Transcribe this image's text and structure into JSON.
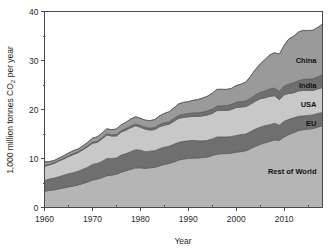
{
  "chart_data": {
    "type": "area",
    "title": "",
    "subtitle": "",
    "xlabel": "Year",
    "ylabel": "1,000 million tonnes CO2 per year",
    "ylabel_parts": {
      "pre": "1,000 million tonnes CO",
      "sub": "2",
      "post": " per year"
    },
    "stacked": true,
    "grid": false,
    "legend_position": "inline-right",
    "xlim": [
      1960,
      2018
    ],
    "ylim": [
      0,
      40
    ],
    "xticks": [
      1960,
      1970,
      1980,
      1990,
      2000,
      2010
    ],
    "xtick_labels": [
      "1960",
      "1970",
      "1980",
      "1990",
      "2000",
      "2010"
    ],
    "xminor_step": 5,
    "yticks": [
      0,
      10,
      20,
      30,
      40
    ],
    "ytick_labels": [
      "0",
      "10",
      "20",
      "30",
      "40"
    ],
    "yminor_step": 5,
    "x": [
      1960,
      1961,
      1962,
      1963,
      1964,
      1965,
      1966,
      1967,
      1968,
      1969,
      1970,
      1971,
      1972,
      1973,
      1974,
      1975,
      1976,
      1977,
      1978,
      1979,
      1980,
      1981,
      1982,
      1983,
      1984,
      1985,
      1986,
      1987,
      1988,
      1989,
      1990,
      1991,
      1992,
      1993,
      1994,
      1995,
      1996,
      1997,
      1998,
      1999,
      2000,
      2001,
      2002,
      2003,
      2004,
      2005,
      2006,
      2007,
      2008,
      2009,
      2010,
      2011,
      2012,
      2013,
      2014,
      2015,
      2016,
      2017,
      2018
    ],
    "series": [
      {
        "name": "Rest of World",
        "color": "#b5b5b5",
        "label": "Rest of World",
        "values": [
          3.3,
          3.5,
          3.6,
          3.8,
          4.0,
          4.2,
          4.4,
          4.6,
          4.9,
          5.2,
          5.6,
          5.8,
          6.1,
          6.5,
          6.6,
          6.8,
          7.2,
          7.5,
          7.8,
          8.1,
          8.1,
          8.0,
          8.1,
          8.2,
          8.5,
          8.8,
          9.0,
          9.3,
          9.7,
          9.9,
          10.0,
          10.1,
          10.1,
          10.2,
          10.3,
          10.6,
          10.9,
          11.0,
          11.0,
          11.1,
          11.3,
          11.4,
          11.6,
          12.0,
          12.5,
          12.9,
          13.2,
          13.5,
          13.8,
          13.7,
          14.4,
          14.9,
          15.3,
          15.7,
          15.9,
          16.0,
          16.1,
          16.4,
          16.7
        ]
      },
      {
        "name": "EU",
        "color": "#6f6f6f",
        "label": "EU",
        "values": [
          2.2,
          2.3,
          2.4,
          2.5,
          2.6,
          2.7,
          2.7,
          2.8,
          2.9,
          3.0,
          3.2,
          3.2,
          3.3,
          3.5,
          3.4,
          3.3,
          3.5,
          3.5,
          3.6,
          3.7,
          3.6,
          3.4,
          3.4,
          3.4,
          3.5,
          3.5,
          3.5,
          3.6,
          3.6,
          3.6,
          3.6,
          3.6,
          3.5,
          3.4,
          3.4,
          3.4,
          3.5,
          3.4,
          3.4,
          3.4,
          3.4,
          3.5,
          3.4,
          3.5,
          3.5,
          3.5,
          3.5,
          3.4,
          3.4,
          3.1,
          3.2,
          3.1,
          3.0,
          2.9,
          2.8,
          2.8,
          2.8,
          2.8,
          2.7
        ]
      },
      {
        "name": "USA",
        "color": "#c8c8c8",
        "label": "USA",
        "values": [
          2.9,
          2.9,
          3.0,
          3.2,
          3.3,
          3.5,
          3.7,
          3.8,
          4.0,
          4.2,
          4.3,
          4.3,
          4.6,
          4.8,
          4.6,
          4.5,
          4.7,
          4.8,
          4.9,
          4.9,
          4.7,
          4.6,
          4.3,
          4.3,
          4.5,
          4.5,
          4.5,
          4.7,
          4.9,
          4.9,
          4.9,
          4.9,
          5.0,
          5.1,
          5.2,
          5.2,
          5.4,
          5.4,
          5.4,
          5.5,
          5.7,
          5.6,
          5.6,
          5.6,
          5.7,
          5.8,
          5.7,
          5.8,
          5.6,
          5.2,
          5.4,
          5.3,
          5.1,
          5.2,
          5.2,
          5.1,
          5.0,
          5.0,
          5.1
        ]
      },
      {
        "name": "India",
        "color": "#6f6f6f",
        "label": "India",
        "values": [
          0.12,
          0.13,
          0.14,
          0.15,
          0.16,
          0.17,
          0.17,
          0.18,
          0.19,
          0.2,
          0.21,
          0.22,
          0.24,
          0.25,
          0.26,
          0.28,
          0.29,
          0.31,
          0.32,
          0.34,
          0.35,
          0.38,
          0.4,
          0.42,
          0.45,
          0.49,
          0.52,
          0.56,
          0.6,
          0.64,
          0.68,
          0.72,
          0.75,
          0.78,
          0.82,
          0.88,
          0.93,
          0.97,
          1.0,
          1.05,
          1.09,
          1.11,
          1.14,
          1.18,
          1.25,
          1.3,
          1.38,
          1.48,
          1.57,
          1.7,
          1.8,
          1.92,
          2.05,
          2.12,
          2.25,
          2.3,
          2.38,
          2.46,
          2.62
        ]
      },
      {
        "name": "China",
        "color": "#9a9a9a",
        "label": "China",
        "values": [
          0.78,
          0.55,
          0.44,
          0.45,
          0.5,
          0.55,
          0.62,
          0.55,
          0.58,
          0.7,
          0.82,
          0.9,
          0.95,
          1.0,
          1.02,
          1.15,
          1.18,
          1.3,
          1.45,
          1.48,
          1.45,
          1.45,
          1.52,
          1.62,
          1.75,
          1.9,
          2.02,
          2.18,
          2.35,
          2.42,
          2.42,
          2.55,
          2.68,
          2.85,
          3.0,
          3.25,
          3.38,
          3.35,
          3.3,
          3.25,
          3.4,
          3.55,
          3.85,
          4.5,
          5.2,
          5.8,
          6.4,
          6.95,
          7.2,
          7.6,
          8.3,
          9.2,
          9.5,
          9.9,
          10.0,
          9.9,
          9.9,
          10.1,
          10.3
        ]
      }
    ],
    "totals_note": "",
    "labels_on_plot": [
      {
        "text": "China",
        "series": "China"
      },
      {
        "text": "India",
        "series": "India"
      },
      {
        "text": "USA",
        "series": "USA"
      },
      {
        "text": "EU",
        "series": "EU"
      },
      {
        "text": "Rest of World",
        "series": "Rest of World"
      }
    ],
    "colors": {
      "rest_of_world": "#b5b5b5",
      "eu": "#6f6f6f",
      "usa": "#c8c8c8",
      "india": "#6f6f6f",
      "china": "#9a9a9a",
      "axis": "#4a4a4a",
      "text": "#1f1f1f",
      "background": "#ffffff"
    }
  }
}
